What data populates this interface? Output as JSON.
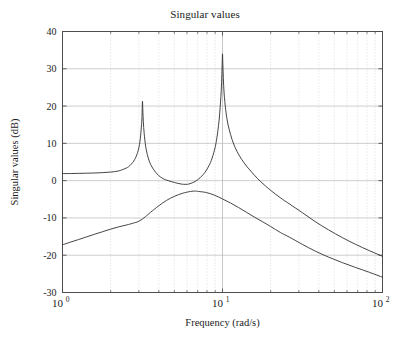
{
  "figure": {
    "width": 410,
    "height": 337,
    "background": "#ffffff",
    "axes_color": "#4d4d4d",
    "grid_major_color": "#b8b8b8",
    "grid_minor_color": "#cfcfcf",
    "curve_color": "#3a3a3a"
  },
  "chart_data": {
    "type": "line",
    "title": "Singular values",
    "xlabel": "Frequency (rad/s)",
    "ylabel": "Singular values (dB)",
    "xscale": "log",
    "yscale": "linear",
    "xlim": [
      1,
      100
    ],
    "ylim": [
      -30,
      40
    ],
    "grid": true,
    "legend": "none",
    "xticks": [
      1,
      10,
      100
    ],
    "xtick_labels": [
      "10^0",
      "10^1",
      "10^2"
    ],
    "xtick_label_bases": [
      "10",
      "10",
      "10"
    ],
    "xtick_label_exponents": [
      "0",
      "1",
      "2"
    ],
    "yticks": [
      -30,
      -20,
      -10,
      0,
      10,
      20,
      30,
      40
    ],
    "ytick_labels": [
      "-30",
      "-20",
      "-10",
      "0",
      "10",
      "20",
      "30",
      "40"
    ],
    "series": [
      {
        "name": "sigma-max",
        "color": "#3a3a3a",
        "x": [
          1.0,
          1.12,
          1.26,
          1.41,
          1.58,
          1.78,
          2.0,
          2.24,
          2.51,
          2.63,
          2.75,
          2.82,
          2.88,
          2.95,
          3.0,
          3.05,
          3.09,
          3.12,
          3.14,
          3.16,
          3.18,
          3.2,
          3.24,
          3.31,
          3.39,
          3.47,
          3.55,
          3.72,
          3.98,
          4.27,
          4.57,
          5.01,
          5.5,
          5.89,
          6.17,
          6.46,
          6.76,
          7.08,
          7.41,
          7.76,
          8.13,
          8.51,
          8.91,
          9.12,
          9.33,
          9.55,
          9.77,
          9.89,
          9.95,
          10.0,
          10.05,
          10.12,
          10.23,
          10.47,
          10.72,
          11.0,
          11.48,
          12.02,
          12.59,
          13.18,
          14.13,
          15.14,
          16.6,
          18.2,
          20.0,
          23.0,
          26.3,
          31.6,
          38.0,
          46.0,
          56.2,
          68.0,
          83.0,
          100.0
        ],
        "y": [
          1.9,
          1.9,
          1.95,
          2.0,
          2.05,
          2.15,
          2.3,
          2.6,
          3.4,
          4.0,
          4.9,
          5.6,
          6.4,
          7.6,
          8.8,
          10.6,
          12.8,
          15.0,
          17.2,
          21.3,
          18.4,
          15.8,
          12.6,
          9.2,
          7.0,
          5.5,
          4.4,
          2.9,
          1.4,
          0.5,
          0.0,
          -0.5,
          -0.9,
          -1.0,
          -0.9,
          -0.6,
          -0.2,
          0.4,
          1.2,
          2.2,
          3.6,
          5.4,
          8.2,
          10.2,
          13.0,
          16.8,
          22.5,
          27.5,
          31.0,
          34.0,
          31.2,
          27.6,
          23.5,
          19.0,
          16.0,
          13.8,
          11.0,
          8.8,
          7.1,
          5.7,
          3.9,
          2.4,
          0.5,
          -1.1,
          -2.6,
          -4.6,
          -6.3,
          -8.6,
          -11.0,
          -13.2,
          -15.3,
          -17.1,
          -18.8,
          -20.3
        ]
      },
      {
        "name": "sigma-min",
        "color": "#3a3a3a",
        "x": [
          1.0,
          1.12,
          1.26,
          1.41,
          1.58,
          1.78,
          2.0,
          2.24,
          2.51,
          2.82,
          3.0,
          3.16,
          3.31,
          3.55,
          3.98,
          4.47,
          5.01,
          5.62,
          6.31,
          6.76,
          7.08,
          7.94,
          8.91,
          10.0,
          11.22,
          12.59,
          14.13,
          15.85,
          17.78,
          20.0,
          23.0,
          26.3,
          31.6,
          38.0,
          46.0,
          56.2,
          68.0,
          83.0,
          100.0
        ],
        "y": [
          -17.2,
          -16.5,
          -15.8,
          -15.1,
          -14.4,
          -13.7,
          -13.0,
          -12.4,
          -11.9,
          -11.3,
          -10.9,
          -10.3,
          -9.6,
          -8.5,
          -6.8,
          -5.3,
          -4.2,
          -3.4,
          -2.9,
          -2.8,
          -2.9,
          -3.2,
          -3.9,
          -4.9,
          -6.0,
          -7.2,
          -8.5,
          -9.8,
          -11.0,
          -12.3,
          -13.9,
          -15.2,
          -17.1,
          -18.9,
          -20.5,
          -22.0,
          -23.3,
          -24.6,
          -25.9
        ]
      }
    ],
    "annotations": [
      {
        "label": "first-resonant-peak",
        "x": 3.16,
        "y": 21.3
      },
      {
        "label": "second-resonant-peak",
        "x": 10.0,
        "y": 34.0
      },
      {
        "label": "anti-resonance-valley",
        "x": 5.7,
        "y": -1.0
      },
      {
        "label": "sigma-min-maximum",
        "x": 6.7,
        "y": -2.8
      }
    ]
  }
}
